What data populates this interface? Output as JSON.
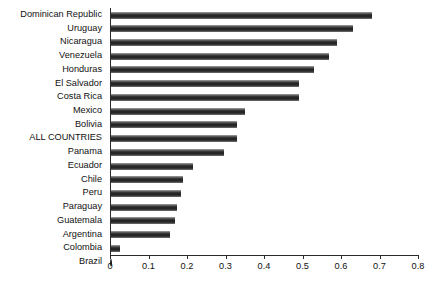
{
  "chart_data": {
    "type": "bar",
    "orientation": "horizontal",
    "title": "",
    "subtitle": "",
    "xlabel": "",
    "ylabel": "",
    "xlim": [
      0,
      0.8
    ],
    "xticks": [
      "0",
      "0.1",
      "0.2",
      "0.3",
      "0.4",
      "0.5",
      "0.6",
      "0.7",
      "0.8"
    ],
    "xtick_values": [
      0,
      0.1,
      0.2,
      0.3,
      0.4,
      0.5,
      0.6,
      0.7,
      0.8
    ],
    "grid": false,
    "legend": null,
    "bar_color": "#2b2b2b",
    "categories": [
      "Dominican Republic",
      "Uruguay",
      "Nicaragua",
      "Venezuela",
      "Honduras",
      "El Salvador",
      "Costa Rica",
      "Mexico",
      "Bolivia",
      "ALL COUNTRIES",
      "Panama",
      "Ecuador",
      "Chile",
      "Peru",
      "Paraguay",
      "Guatemala",
      "Argentina",
      "Colombia",
      "Brazil"
    ],
    "values": [
      0.68,
      0.63,
      0.59,
      0.57,
      0.53,
      0.49,
      0.49,
      0.35,
      0.33,
      0.33,
      0.295,
      0.215,
      0.19,
      0.185,
      0.175,
      0.17,
      0.155,
      0.025,
      0.005
    ]
  }
}
